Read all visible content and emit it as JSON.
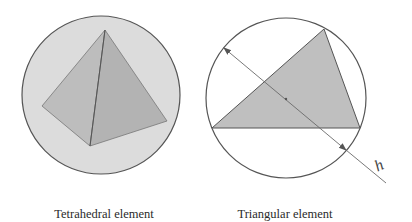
{
  "figures": [
    {
      "id": "tetrahedral",
      "caption": "Tetrahedral element",
      "circle": {
        "cx": 101,
        "cy": 95,
        "r": 79,
        "fill": "#dcdcdc",
        "stroke": "#555555"
      },
      "faces": [
        {
          "name": "left-face",
          "points": "105,30 42,106 90,146",
          "fill": "#bdbdbd"
        },
        {
          "name": "right-face",
          "points": "105,30 90,146 167,121",
          "fill": "#b3b3b3"
        }
      ],
      "edge_color": "#666666"
    },
    {
      "id": "triangular",
      "caption": "Triangular element",
      "circle": {
        "cx": 286,
        "cy": 98,
        "r": 80,
        "fill": "#ffffff",
        "stroke": "#555555"
      },
      "triangle": {
        "points": "324,29 212,128 360,128",
        "fill": "#bfbfbf",
        "stroke": "#555555"
      },
      "diameter_arrow": {
        "x1": 224,
        "y1": 48,
        "x2": 346,
        "y2": 150,
        "ext_x": 386,
        "ext_y": 183,
        "color": "#6a6a6a"
      },
      "center_dot": {
        "cx": 286,
        "cy": 99
      },
      "label": "h"
    }
  ]
}
